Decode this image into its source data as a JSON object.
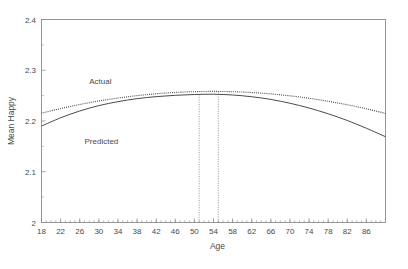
{
  "chart_data": {
    "type": "line",
    "title": "",
    "xlabel": "Age",
    "ylabel": "Mean Happy",
    "xlim": [
      18,
      90
    ],
    "ylim": [
      2,
      2.4
    ],
    "grid": false,
    "legend_position": "inline-annotation",
    "x_ticks": [
      18,
      22,
      26,
      30,
      34,
      38,
      42,
      46,
      50,
      54,
      58,
      62,
      66,
      70,
      74,
      78,
      82,
      86
    ],
    "x_tick_labels": [
      "18",
      "22",
      "26",
      "30",
      "34",
      "38",
      "42",
      "46",
      "50",
      "54",
      "58",
      "62",
      "66",
      "70",
      "74",
      "78",
      "82",
      "86"
    ],
    "x_minor_tick_step": 1,
    "y_ticks": [
      2,
      2.1,
      2.2,
      2.3,
      2.4
    ],
    "y_tick_labels": [
      "2",
      "2.1",
      "2.2",
      "2.3",
      "2.4"
    ],
    "series": [
      {
        "name": "Actual",
        "style": "dotted",
        "label_x": 28,
        "label_y": 2.272,
        "x": [
          18,
          22,
          26,
          30,
          34,
          38,
          42,
          46,
          50,
          54,
          58,
          62,
          66,
          70,
          74,
          78,
          82,
          86,
          90
        ],
        "values": [
          2.2155,
          2.2245,
          2.2325,
          2.2395,
          2.2452,
          2.25,
          2.2537,
          2.2563,
          2.2578,
          2.2583,
          2.2577,
          2.2561,
          2.2534,
          2.2496,
          2.2448,
          2.2389,
          2.232,
          2.224,
          2.215
        ]
      },
      {
        "name": "Predicted",
        "style": "solid",
        "label_x": 27,
        "label_y": 2.155,
        "x": [
          18,
          22,
          26,
          30,
          34,
          38,
          42,
          46,
          50,
          54,
          58,
          62,
          66,
          70,
          74,
          78,
          82,
          86,
          90
        ],
        "values": [
          2.19,
          2.2063,
          2.2197,
          2.2303,
          2.2381,
          2.244,
          2.248,
          2.2506,
          2.2522,
          2.2528,
          2.2513,
          2.2478,
          2.2425,
          2.235,
          2.2256,
          2.2142,
          2.201,
          2.1857,
          2.169
        ]
      }
    ],
    "reference_lines": [
      {
        "name": "predicted-peak-line",
        "x": 51,
        "y_top": 2.2524,
        "y_bottom": 2.0,
        "style": "dotted"
      },
      {
        "name": "actual-peak-line",
        "x": 55,
        "y_top": 2.2578,
        "y_bottom": 2.0,
        "style": "dotted"
      }
    ]
  }
}
